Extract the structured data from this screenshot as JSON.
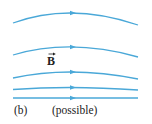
{
  "diagram": {
    "type": "magnetic field lines",
    "line_color": "#4aa8d8",
    "field_symbol": "B",
    "panel_label": "(b)",
    "caption": "(possible)",
    "field_lines": [
      {
        "id": 1,
        "left": [
          13,
          23
        ],
        "peak": [
          73,
          13
        ],
        "right": [
          138,
          25
        ]
      },
      {
        "id": 2,
        "left": [
          13,
          55
        ],
        "peak": [
          73,
          47
        ],
        "right": [
          138,
          57
        ]
      },
      {
        "id": 3,
        "left": [
          13,
          78
        ],
        "peak": [
          73,
          72
        ],
        "right": [
          138,
          79
        ]
      },
      {
        "id": 4,
        "left": [
          13,
          89.5
        ],
        "peak": [
          73,
          87.5
        ],
        "right": [
          138,
          90
        ]
      },
      {
        "id": 5,
        "left": [
          13,
          98
        ],
        "peak": [
          73,
          98
        ],
        "right": [
          138,
          98
        ]
      }
    ],
    "arrow_direction": "right"
  }
}
